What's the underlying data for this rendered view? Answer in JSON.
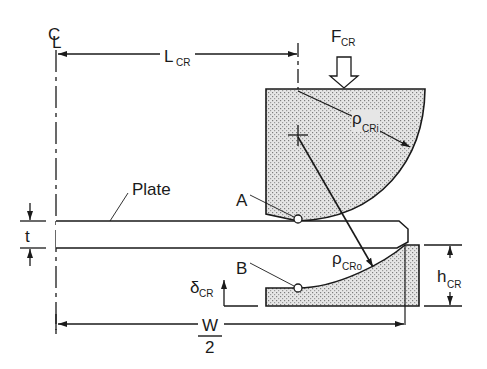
{
  "figure": {
    "type": "crimping die cross-section",
    "colors": {
      "line": "#1a1a1a",
      "hatch_bg": "#e4e4e4",
      "hatch_dot": "#8a8a8a",
      "background": "#ffffff"
    }
  },
  "labels": {
    "centerline": {
      "symbol": "C",
      "sub": "L"
    },
    "length": {
      "main": "L",
      "sub": "CR"
    },
    "force": {
      "main": "F",
      "sub": "CR"
    },
    "inner_radius": {
      "main": "ρ",
      "sub": "CRi"
    },
    "outer_radius": {
      "main": "ρ",
      "sub": "CRo"
    },
    "plate": "Plate",
    "point_a": "A",
    "point_b": "B",
    "thickness": "t",
    "displacement": {
      "main": "δ",
      "sub": "CR"
    },
    "height": {
      "main": "h",
      "sub": "CR"
    },
    "half_width": {
      "numerator": "W",
      "denominator": "2"
    }
  }
}
